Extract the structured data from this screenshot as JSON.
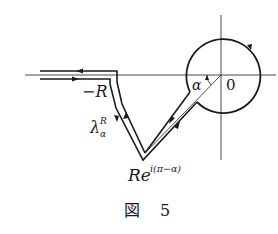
{
  "figure": {
    "caption_prefix": "図",
    "caption_number": "5"
  },
  "labels": {
    "neg_R": "−R",
    "lambda": "λ",
    "lambda_sup": "R",
    "lambda_sub": "α",
    "alpha": "α",
    "origin": "0",
    "endpoint_base": "Re",
    "endpoint_exp": "i(π−α)"
  },
  "colors": {
    "ink": "#1a1a1a",
    "background": "#ffffff"
  }
}
